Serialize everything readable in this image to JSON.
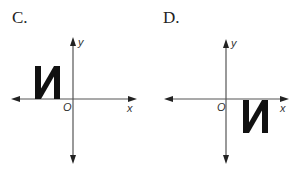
{
  "panels": [
    {
      "label": "C.",
      "axes": {
        "x_label": "x",
        "y_label": "y",
        "origin_label": "O"
      },
      "figure": {
        "glyph": "reversed-N",
        "quadrant": "II",
        "position": "left of y-axis, above x-axis"
      }
    },
    {
      "label": "D.",
      "axes": {
        "x_label": "x",
        "y_label": "y",
        "origin_label": "O"
      },
      "figure": {
        "glyph": "reversed-N",
        "quadrant": "IV",
        "position": "right of y-axis, below x-axis"
      }
    }
  ],
  "colors": {
    "axis": "#555555",
    "figure": "#111111",
    "text": "#222222"
  }
}
